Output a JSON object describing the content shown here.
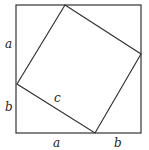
{
  "diagram": {
    "stroke_color": "#333333",
    "outer_square": {
      "x1": 16,
      "y1": 5,
      "x2": 141,
      "y2": 133
    },
    "inner_square": {
      "points": [
        [
          65,
          5
        ],
        [
          141,
          54
        ],
        [
          95,
          133
        ],
        [
          17,
          84
        ]
      ]
    },
    "labels": {
      "left_top": "a",
      "left_bottom": "b",
      "bottom_left": "a",
      "bottom_right": "b",
      "hypotenuse": "c"
    }
  }
}
